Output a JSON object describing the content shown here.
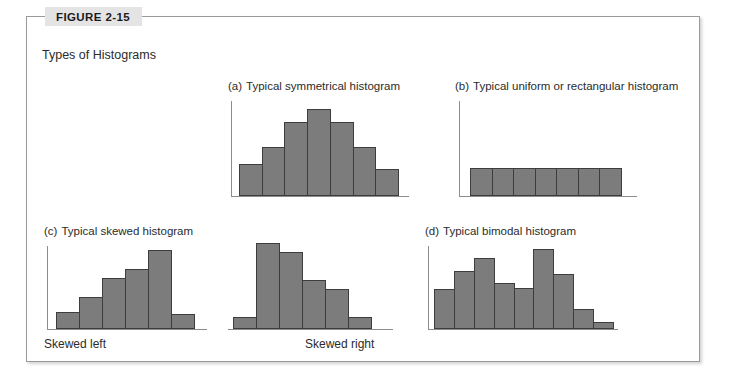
{
  "figure": {
    "number_label": "FIGURE 2-15",
    "caption": "Types of Histograms"
  },
  "panels": [
    {
      "tag": "(a)",
      "title": "Typical symmetrical histogram"
    },
    {
      "tag": "(b)",
      "title": "Typical uniform or rectangular histogram"
    },
    {
      "tag": "(c)",
      "title": "Typical skewed histogram"
    },
    {
      "tag": "(d)",
      "title": "Typical bimodal histogram"
    }
  ],
  "sub_labels": {
    "skewed_left": "Skewed left",
    "skewed_right": "Skewed right"
  },
  "colors": {
    "bar_fill": "#7c7c7c",
    "bar_stroke": "#3d3d3d",
    "axis": "#8c8c8c",
    "frame": "#9a9a9a",
    "badge_bg": "#e4e4e4",
    "text": "#2b2b2b"
  },
  "chart_data": [
    {
      "id": "symmetrical",
      "type": "bar",
      "title": "(a) Typical symmetrical histogram",
      "xlabel": "",
      "ylabel": "",
      "categories": [
        "1",
        "2",
        "3",
        "4",
        "5",
        "6",
        "7"
      ],
      "values": [
        34,
        52,
        78,
        92,
        78,
        52,
        28
      ],
      "ylim": [
        0,
        100
      ],
      "grid": false,
      "legend": "none"
    },
    {
      "id": "uniform",
      "type": "bar",
      "title": "(b) Typical uniform or rectangular histogram",
      "xlabel": "",
      "ylabel": "",
      "categories": [
        "1",
        "2",
        "3",
        "4",
        "5",
        "6",
        "7"
      ],
      "values": [
        30,
        30,
        30,
        30,
        30,
        30,
        30
      ],
      "ylim": [
        0,
        100
      ],
      "grid": false,
      "legend": "none"
    },
    {
      "id": "skewed-left",
      "type": "bar",
      "title": "(c) Typical skewed histogram — Skewed left",
      "xlabel": "Skewed left",
      "ylabel": "",
      "categories": [
        "1",
        "2",
        "3",
        "4",
        "5",
        "6"
      ],
      "values": [
        20,
        38,
        62,
        72,
        95,
        18
      ],
      "ylim": [
        0,
        100
      ],
      "grid": false,
      "legend": "none"
    },
    {
      "id": "skewed-right",
      "type": "bar",
      "title": "Skewed right",
      "xlabel": "Skewed right",
      "ylabel": "",
      "categories": [
        "1",
        "2",
        "3",
        "4",
        "5",
        "6"
      ],
      "values": [
        14,
        97,
        86,
        55,
        45,
        13
      ],
      "ylim": [
        0,
        100
      ],
      "grid": false,
      "legend": "none"
    },
    {
      "id": "bimodal",
      "type": "bar",
      "title": "(d) Typical bimodal histogram",
      "xlabel": "",
      "ylabel": "",
      "categories": [
        "1",
        "2",
        "3",
        "4",
        "5",
        "6",
        "7",
        "8",
        "9"
      ],
      "values": [
        48,
        70,
        86,
        56,
        50,
        96,
        66,
        24,
        8
      ],
      "ylim": [
        0,
        100
      ],
      "grid": false,
      "legend": "none"
    }
  ]
}
